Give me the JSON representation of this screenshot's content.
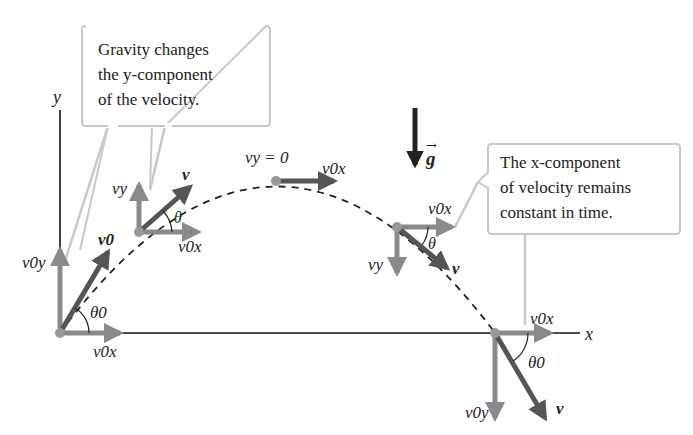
{
  "diagram": {
    "callouts": [
      {
        "id": "gravity",
        "lines": [
          "Gravity changes",
          "the y-component",
          "of the velocity."
        ]
      },
      {
        "id": "xconst",
        "lines": [
          "The x-component",
          "of velocity remains",
          "constant in time."
        ]
      }
    ],
    "axes": {
      "x_label": "x",
      "y_label": "y"
    },
    "gravity_label": "g",
    "points": [
      {
        "name": "launch",
        "labels": {
          "vy": "v0y",
          "v": "v0",
          "vx": "v0x",
          "angle": "θ0"
        }
      },
      {
        "name": "rising",
        "labels": {
          "vy": "vy",
          "v": "v",
          "vx": "v0x",
          "angle": "θ"
        }
      },
      {
        "name": "apex",
        "labels": {
          "note": "vy = 0",
          "vx": "v0x"
        }
      },
      {
        "name": "falling",
        "labels": {
          "vy": "vy",
          "v": "v",
          "vx": "v0x",
          "angle": "θ"
        }
      },
      {
        "name": "landing",
        "labels": {
          "vy": "v0y",
          "v": "v",
          "vx": "v0x",
          "angle": "θ0"
        }
      }
    ],
    "colors": {
      "component_arrow": "#8a8a8a",
      "velocity_arrow": "#555555",
      "axis": "#111111",
      "callout_border": "#c8c8c8",
      "trajectory": "#222222"
    }
  }
}
